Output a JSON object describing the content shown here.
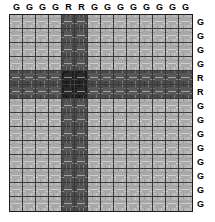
{
  "figure": {
    "title": "",
    "type": "matrix-grid",
    "size": {
      "rows": 14,
      "cols": 14
    }
  },
  "legend": {
    "g_label": "G",
    "r_label": "R"
  },
  "colors": {
    "gg_cell": "#b4b4b4",
    "mixed_cell": "#4a4a4a",
    "rr_cell": "#202020",
    "grid_line": "#3a3a3a",
    "label_text": "#000000",
    "background": "#ffffff"
  },
  "chart_data": {
    "type": "heatmap",
    "title": "",
    "xlabel": "",
    "ylabel": "",
    "column_labels": [
      "G",
      "G",
      "G",
      "G",
      "R",
      "R",
      "G",
      "G",
      "G",
      "G",
      "G",
      "G",
      "G",
      "G"
    ],
    "row_labels": [
      "G",
      "G",
      "G",
      "G",
      "R",
      "R",
      "G",
      "G",
      "G",
      "G",
      "G",
      "G",
      "G",
      "G"
    ],
    "legend": [
      "G",
      "R"
    ],
    "grid": true,
    "legend_position": "none",
    "cell_classes": [
      [
        "gg",
        "gg",
        "gg",
        "gg",
        "gr",
        "gr",
        "gg",
        "gg",
        "gg",
        "gg",
        "gg",
        "gg",
        "gg",
        "gg"
      ],
      [
        "gg",
        "gg",
        "gg",
        "gg",
        "gr",
        "gr",
        "gg",
        "gg",
        "gg",
        "gg",
        "gg",
        "gg",
        "gg",
        "gg"
      ],
      [
        "gg",
        "gg",
        "gg",
        "gg",
        "gr",
        "gr",
        "gg",
        "gg",
        "gg",
        "gg",
        "gg",
        "gg",
        "gg",
        "gg"
      ],
      [
        "gg",
        "gg",
        "gg",
        "gg",
        "gr",
        "gr",
        "gg",
        "gg",
        "gg",
        "gg",
        "gg",
        "gg",
        "gg",
        "gg"
      ],
      [
        "rg",
        "rg",
        "rg",
        "rg",
        "rr",
        "rr",
        "rg",
        "rg",
        "rg",
        "rg",
        "rg",
        "rg",
        "rg",
        "rg"
      ],
      [
        "rg",
        "rg",
        "rg",
        "rg",
        "rr",
        "rr",
        "rg",
        "rg",
        "rg",
        "rg",
        "rg",
        "rg",
        "rg",
        "rg"
      ],
      [
        "gg",
        "gg",
        "gg",
        "gg",
        "gr",
        "gr",
        "gg",
        "gg",
        "gg",
        "gg",
        "gg",
        "gg",
        "gg",
        "gg"
      ],
      [
        "gg",
        "gg",
        "gg",
        "gg",
        "gr",
        "gr",
        "gg",
        "gg",
        "gg",
        "gg",
        "gg",
        "gg",
        "gg",
        "gg"
      ],
      [
        "gg",
        "gg",
        "gg",
        "gg",
        "gr",
        "gr",
        "gg",
        "gg",
        "gg",
        "gg",
        "gg",
        "gg",
        "gg",
        "gg"
      ],
      [
        "gg",
        "gg",
        "gg",
        "gg",
        "gr",
        "gr",
        "gg",
        "gg",
        "gg",
        "gg",
        "gg",
        "gg",
        "gg",
        "gg"
      ],
      [
        "gg",
        "gg",
        "gg",
        "gg",
        "gr",
        "gr",
        "gg",
        "gg",
        "gg",
        "gg",
        "gg",
        "gg",
        "gg",
        "gg"
      ],
      [
        "gg",
        "gg",
        "gg",
        "gg",
        "gr",
        "gr",
        "gg",
        "gg",
        "gg",
        "gg",
        "gg",
        "gg",
        "gg",
        "gg"
      ],
      [
        "gg",
        "gg",
        "gg",
        "gg",
        "gr",
        "gr",
        "gg",
        "gg",
        "gg",
        "gg",
        "gg",
        "gg",
        "gg",
        "gg"
      ],
      [
        "gg",
        "gg",
        "gg",
        "gg",
        "gr",
        "gr",
        "gg",
        "gg",
        "gg",
        "gg",
        "gg",
        "gg",
        "gg",
        "gg"
      ]
    ],
    "values": [
      [
        0,
        0,
        0,
        0,
        1,
        1,
        0,
        0,
        0,
        0,
        0,
        0,
        0,
        0
      ],
      [
        0,
        0,
        0,
        0,
        1,
        1,
        0,
        0,
        0,
        0,
        0,
        0,
        0,
        0
      ],
      [
        0,
        0,
        0,
        0,
        1,
        1,
        0,
        0,
        0,
        0,
        0,
        0,
        0,
        0
      ],
      [
        0,
        0,
        0,
        0,
        1,
        1,
        0,
        0,
        0,
        0,
        0,
        0,
        0,
        0
      ],
      [
        1,
        1,
        1,
        1,
        2,
        2,
        1,
        1,
        1,
        1,
        1,
        1,
        1,
        1
      ],
      [
        1,
        1,
        1,
        1,
        2,
        2,
        1,
        1,
        1,
        1,
        1,
        1,
        1,
        1
      ],
      [
        0,
        0,
        0,
        0,
        1,
        1,
        0,
        0,
        0,
        0,
        0,
        0,
        0,
        0
      ],
      [
        0,
        0,
        0,
        0,
        1,
        1,
        0,
        0,
        0,
        0,
        0,
        0,
        0,
        0
      ],
      [
        0,
        0,
        0,
        0,
        1,
        1,
        0,
        0,
        0,
        0,
        0,
        0,
        0,
        0
      ],
      [
        0,
        0,
        0,
        0,
        1,
        1,
        0,
        0,
        0,
        0,
        0,
        0,
        0,
        0
      ],
      [
        0,
        0,
        0,
        0,
        1,
        1,
        0,
        0,
        0,
        0,
        0,
        0,
        0,
        0
      ],
      [
        0,
        0,
        0,
        0,
        1,
        1,
        0,
        0,
        0,
        0,
        0,
        0,
        0,
        0
      ],
      [
        0,
        0,
        0,
        0,
        1,
        1,
        0,
        0,
        0,
        0,
        0,
        0,
        0,
        0
      ],
      [
        0,
        0,
        0,
        0,
        1,
        1,
        0,
        0,
        0,
        0,
        0,
        0,
        0,
        0
      ]
    ]
  }
}
